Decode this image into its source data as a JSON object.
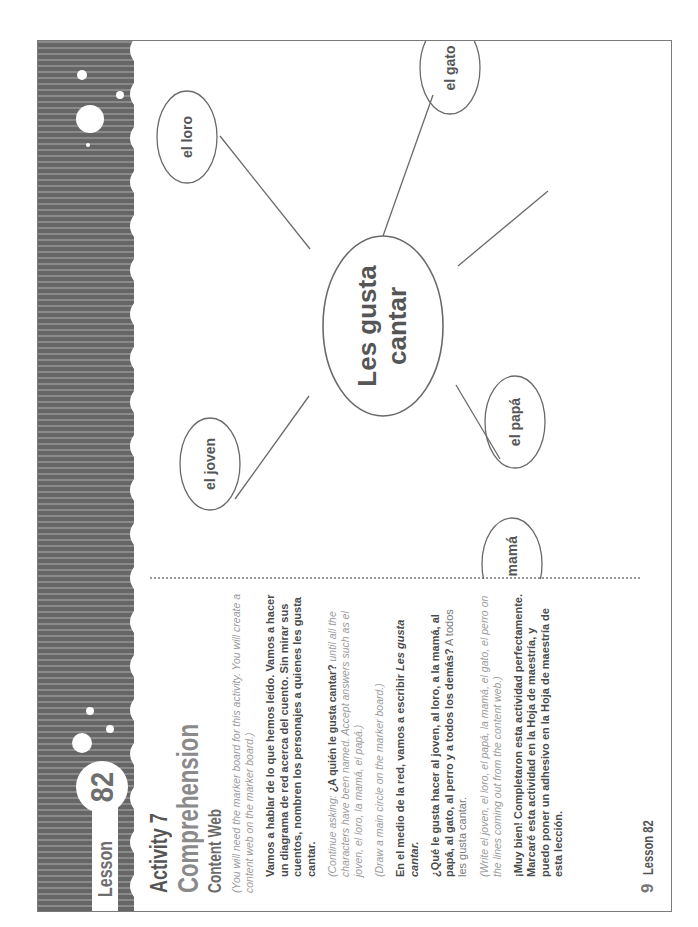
{
  "header": {
    "lesson_word": "Lesson",
    "lesson_number": "82"
  },
  "activity": {
    "label": "Activity 7",
    "title": "Comprehension",
    "subtitle": "Content Web"
  },
  "instructions": {
    "note_1": "(You will need the marker board for this activity. You will create a content web on the marker board.)",
    "para_1": "Vamos a hablar de lo que hemos leído. Vamos a hacer un diagrama de red acerca del cuento. Sin mirar sus cuentos, nombren los personajes a quienes les gusta cantar.",
    "note_2_prefix": "(Continue asking: ",
    "note_2_bold": "¿A quién le gusta cantar?",
    "note_2_suffix": " until all the characters have been named. Accept answers such as el joven, el loro, la mamá, el papá.)",
    "note_3": "(Draw a main circle on the marker board.)",
    "para_2_prefix": "En el medio de la red, vamos a escribir ",
    "para_2_italic": "Les gusta cantar.",
    "para_3_bold": "¿Qué le gusta hacer al joven, al loro, a la mamá, al papá, al gato, al perro y a todos los demás?",
    "para_3_plain": " A todos les gusta cantar.",
    "note_4": "(Write el joven, el loro, el papá, la mamá, el gato, el perro on the lines coming out from the content web.)",
    "para_4": "¡Muy bien! Completaron esta actividad perfectamente. Marcaré esta actividad en la Hoja de maestría, y puedo poner un adhesivo en la Hoja de maestría de esta lección."
  },
  "footer": {
    "page_number": "9",
    "lesson_label": "Lesson 82"
  },
  "content_web": {
    "center": {
      "line1": "Les gusta",
      "line2": "cantar"
    },
    "nodes": [
      {
        "label": "el joven"
      },
      {
        "label": "el loro"
      },
      {
        "label": "el gato"
      },
      {
        "label": "el papá"
      },
      {
        "label": "la mamá"
      }
    ]
  }
}
